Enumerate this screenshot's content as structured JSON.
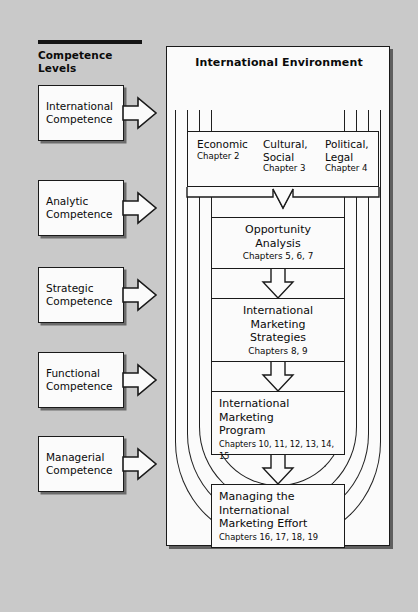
{
  "diagram": {
    "background_color": "#c9c9c9",
    "line_color": "#1a1a1a",
    "panel_color": "#fbfbfb"
  },
  "left_panel": {
    "heading": "Competence\nLevels",
    "items": [
      {
        "label": "International\nCompetence",
        "arrow": "right-arrow-icon"
      },
      {
        "label": "Analytic\nCompetence",
        "arrow": "right-arrow-icon"
      },
      {
        "label": "Strategic\nCompetence",
        "arrow": "right-arrow-icon"
      },
      {
        "label": "Functional\nCompetence",
        "arrow": "right-arrow-icon"
      },
      {
        "label": "Managerial\nCompetence",
        "arrow": "right-arrow-icon"
      }
    ]
  },
  "environment": {
    "title": "International Environment",
    "factors": [
      {
        "name": "Economic",
        "chapter": "Chapter 2"
      },
      {
        "name": "Cultural,\nSocial",
        "chapter": "Chapter 3"
      },
      {
        "name": "Political,\nLegal",
        "chapter": "Chapter 4"
      }
    ],
    "stages": [
      {
        "title": "Opportunity\nAnalysis",
        "chapter": "Chapters 5, 6, 7",
        "align": "center"
      },
      {
        "title": "International\nMarketing\nStrategies",
        "chapter": "Chapters 8, 9",
        "align": "center"
      },
      {
        "title": "International\nMarketing\nProgram",
        "chapter": "Chapters 10, 11, 12, 13, 14, 15",
        "align": "left"
      },
      {
        "title": "Managing the\nInternational\nMarketing Effort",
        "chapter": "Chapters 16, 17, 18, 19",
        "align": "left"
      }
    ],
    "connector_icons": [
      "converging-bracket-arrow-icon",
      "down-arrow-icon",
      "down-arrow-icon",
      "down-arrow-icon"
    ]
  }
}
